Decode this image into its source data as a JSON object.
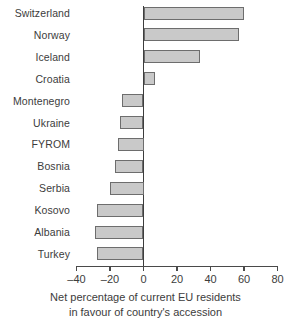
{
  "chart_data": {
    "type": "bar",
    "orientation": "horizontal",
    "title": "",
    "subtitle": "",
    "xlabel": "Net percentage of current EU residents in favour of country's accession",
    "xlabel_line1": "Net percentage of current EU residents",
    "xlabel_line2": "in favour of country's accession",
    "ylabel": "",
    "categories": [
      "Switzerland",
      "Norway",
      "Iceland",
      "Croatia",
      "Montenegro",
      "Ukraine",
      "FYROM",
      "Bosnia",
      "Serbia",
      "Kosovo",
      "Albania",
      "Turkey"
    ],
    "values": [
      60,
      57,
      34,
      7,
      -13,
      -14,
      -15,
      -17,
      -20,
      -28,
      -29,
      -28
    ],
    "xlim": [
      -40,
      80
    ],
    "xticks": [
      -40,
      -20,
      0,
      20,
      40,
      60,
      80
    ],
    "xtick_labels": [
      "–40",
      "–20",
      "0",
      "20",
      "40",
      "60",
      "80"
    ],
    "grid": false,
    "legend": false,
    "bar_color": "#c9c9c9",
    "bar_edge_color": "#6d6d6d",
    "axis_color": "#4a4a4a",
    "text_color": "#3c3c3c",
    "background": "#ffffff"
  }
}
